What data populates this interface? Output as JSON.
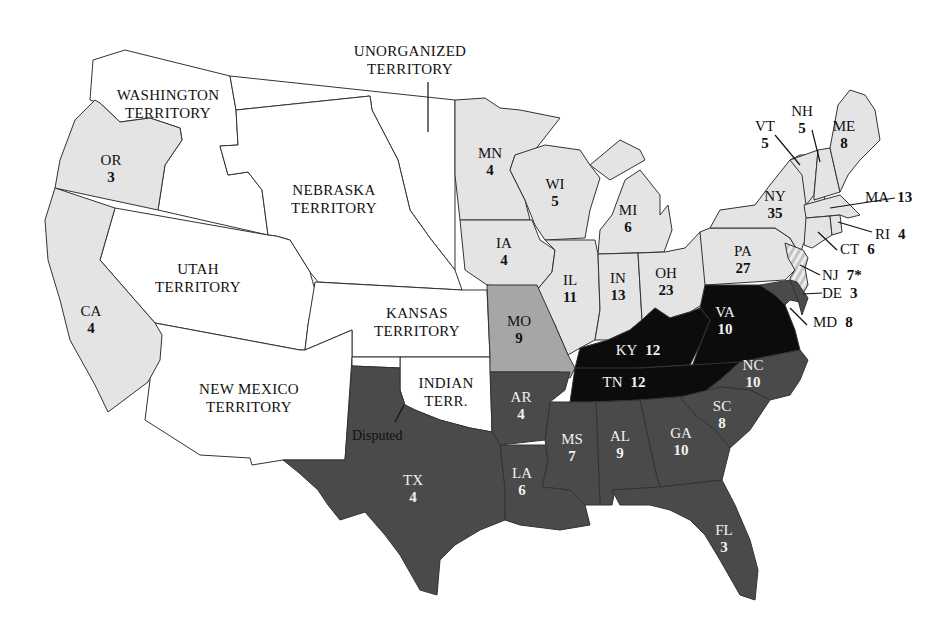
{
  "map": {
    "colors": {
      "republican": "#e4e4e4",
      "douglas": "#a6a6a6",
      "breckinridge": "#4a4a4a",
      "bell": "#0c0c0c",
      "territory": "#ffffff",
      "split_nj": "#d0d0d0",
      "border": "#333333"
    },
    "territories": [
      {
        "id": "washington",
        "line1": "WASHINGTON",
        "line2": "TERRITORY"
      },
      {
        "id": "unorganized",
        "line1": "UNORGANIZED",
        "line2": "TERRITORY"
      },
      {
        "id": "nebraska",
        "line1": "NEBRASKA",
        "line2": "TERRITORY"
      },
      {
        "id": "utah",
        "line1": "UTAH",
        "line2": "TERRITORY"
      },
      {
        "id": "kansas",
        "line1": "KANSAS",
        "line2": "TERRITORY"
      },
      {
        "id": "new_mexico",
        "line1": "NEW MEXICO",
        "line2": "TERRITORY"
      },
      {
        "id": "indian",
        "line1": "INDIAN",
        "line2": "TERR."
      }
    ],
    "disputed_label": "Disputed",
    "states": {
      "OR": {
        "abbr": "OR",
        "ev": "3"
      },
      "CA": {
        "abbr": "CA",
        "ev": "4"
      },
      "MN": {
        "abbr": "MN",
        "ev": "4"
      },
      "WI": {
        "abbr": "WI",
        "ev": "5"
      },
      "MI": {
        "abbr": "MI",
        "ev": "6"
      },
      "IA": {
        "abbr": "IA",
        "ev": "4"
      },
      "IL": {
        "abbr": "IL",
        "ev": "11"
      },
      "IN": {
        "abbr": "IN",
        "ev": "13"
      },
      "OH": {
        "abbr": "OH",
        "ev": "23"
      },
      "PA": {
        "abbr": "PA",
        "ev": "27"
      },
      "NY": {
        "abbr": "NY",
        "ev": "35"
      },
      "VT": {
        "abbr": "VT",
        "ev": "5"
      },
      "NH": {
        "abbr": "NH",
        "ev": "5"
      },
      "ME": {
        "abbr": "ME",
        "ev": "8"
      },
      "MA": {
        "abbr": "MA",
        "ev": "13"
      },
      "RI": {
        "abbr": "RI",
        "ev": "4"
      },
      "CT": {
        "abbr": "CT",
        "ev": "6"
      },
      "NJ": {
        "abbr": "NJ",
        "ev": "7*"
      },
      "DE": {
        "abbr": "DE",
        "ev": "3"
      },
      "MD": {
        "abbr": "MD",
        "ev": "8"
      },
      "MO": {
        "abbr": "MO",
        "ev": "9"
      },
      "VA": {
        "abbr": "VA",
        "ev": "10"
      },
      "KY": {
        "abbr": "KY",
        "ev": "12"
      },
      "TN": {
        "abbr": "TN",
        "ev": "12"
      },
      "NC": {
        "abbr": "NC",
        "ev": "10"
      },
      "SC": {
        "abbr": "SC",
        "ev": "8"
      },
      "GA": {
        "abbr": "GA",
        "ev": "10"
      },
      "AL": {
        "abbr": "AL",
        "ev": "9"
      },
      "MS": {
        "abbr": "MS",
        "ev": "7"
      },
      "LA": {
        "abbr": "LA",
        "ev": "6"
      },
      "AR": {
        "abbr": "AR",
        "ev": "4"
      },
      "TX": {
        "abbr": "TX",
        "ev": "4"
      },
      "FL": {
        "abbr": "FL",
        "ev": "3"
      }
    }
  }
}
